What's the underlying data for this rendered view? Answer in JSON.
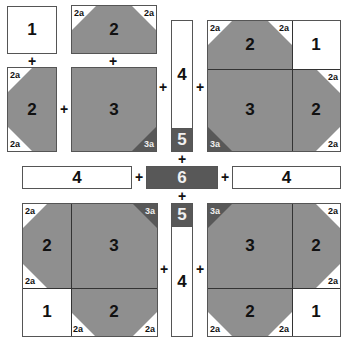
{
  "colors": {
    "white_piece": "#ffffff",
    "gray_piece": "#8f8f8f",
    "dark_piece": "#585858",
    "border": "#555555"
  },
  "symbols": {
    "plus": "+"
  },
  "labels": {
    "piece_1": "1",
    "piece_2": "2",
    "piece_3": "3",
    "piece_4": "4",
    "piece_5": "5",
    "piece_6": "6",
    "corner_2a": "2a",
    "corner_3a": "3a"
  },
  "quadrants": {
    "top_left": {
      "layout": "exploded",
      "pieces": [
        "1",
        "2",
        "2",
        "3"
      ],
      "corners": [
        "2a",
        "2a",
        "2a",
        "2a",
        "3a"
      ]
    },
    "top_right": {
      "layout": "assembled",
      "pieces": [
        "2",
        "1",
        "3",
        "2"
      ],
      "corners": [
        "2a",
        "2a",
        "2a",
        "2a",
        "3a"
      ]
    },
    "bottom_left": {
      "layout": "assembled",
      "pieces": [
        "2",
        "3",
        "1",
        "2"
      ],
      "corners": [
        "2a",
        "2a",
        "2a",
        "2a",
        "3a"
      ]
    },
    "bottom_right": {
      "layout": "assembled",
      "pieces": [
        "3",
        "2",
        "2",
        "1"
      ],
      "corners": [
        "2a",
        "2a",
        "2a",
        "2a",
        "3a"
      ]
    }
  },
  "center": {
    "strips": [
      "4",
      "5",
      "6",
      "5",
      "4"
    ],
    "side_strips": [
      "4",
      "4"
    ]
  }
}
